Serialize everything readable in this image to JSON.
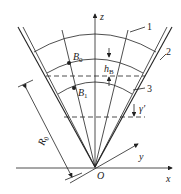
{
  "labels": {
    "z": "z",
    "x": "x",
    "y": "y",
    "origin": "O",
    "b0": "B",
    "b0_sub": "0",
    "b1": "B",
    "b1_sub": "1",
    "hb": "h",
    "hb_sub": "B",
    "gamma": "γ'",
    "r0": "R",
    "r0_sub": "0",
    "n1": "1",
    "n2": "2",
    "n3": "3"
  },
  "colors": {
    "ink": "#222222"
  }
}
